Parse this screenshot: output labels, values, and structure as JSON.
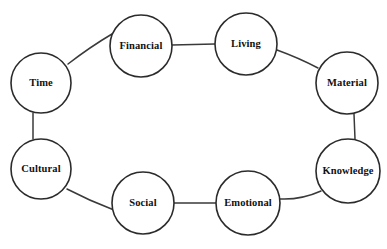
{
  "diagram": {
    "type": "cycle-diagram",
    "title": "",
    "background_color": "#ffffff",
    "node_fill_color": "#ffffff",
    "node_stroke_color": "#2b2b2b",
    "link_color": "#3a3a3a",
    "label_color": "#111111",
    "nodes": [
      {
        "id": "time",
        "label": "Time",
        "cx": 41,
        "cy": 83,
        "r": 30
      },
      {
        "id": "financial",
        "label": "Financial",
        "cx": 141,
        "cy": 46,
        "r": 31
      },
      {
        "id": "living",
        "label": "Living",
        "cx": 246,
        "cy": 44,
        "r": 31
      },
      {
        "id": "material",
        "label": "Material",
        "cx": 347,
        "cy": 83,
        "r": 31
      },
      {
        "id": "knowledge",
        "label": "Knowledge",
        "cx": 348,
        "cy": 171,
        "r": 32
      },
      {
        "id": "emotional",
        "label": "Emotional",
        "cx": 248,
        "cy": 203,
        "r": 32
      },
      {
        "id": "social",
        "label": "Social",
        "cx": 143,
        "cy": 203,
        "r": 31
      },
      {
        "id": "cultural",
        "label": "Cultural",
        "cx": 41,
        "cy": 169,
        "r": 30
      }
    ],
    "links": [
      {
        "from": "time",
        "to": "financial",
        "shape": "curve",
        "d": "M 68,64 Q 90,47 112,34"
      },
      {
        "from": "financial",
        "to": "living",
        "shape": "straight",
        "d": "M 172,45 L 215,44"
      },
      {
        "from": "living",
        "to": "material",
        "shape": "curve",
        "d": "M 277,50 Q 299,58 318,68"
      },
      {
        "from": "material",
        "to": "knowledge",
        "shape": "straight",
        "d": "M 354,114 L 355,139"
      },
      {
        "from": "knowledge",
        "to": "emotional",
        "shape": "curve",
        "d": "M 321,191 Q 301,200 280,199"
      },
      {
        "from": "emotional",
        "to": "social",
        "shape": "straight",
        "d": "M 216,203 L 174,203"
      },
      {
        "from": "social",
        "to": "cultural",
        "shape": "curve",
        "d": "M 114,210 Q 90,201 67,189"
      },
      {
        "from": "cultural",
        "to": "time",
        "shape": "straight",
        "d": "M 33,139 L 33,113"
      }
    ]
  }
}
